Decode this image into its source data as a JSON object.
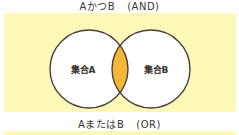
{
  "colors": {
    "panel_bg": "#fdf8b8",
    "circle_fill": "#ffffff",
    "intersection_fill": "#f6b738",
    "stroke": "#4a4038",
    "text": "#3a3530"
  },
  "sections": [
    {
      "title_main": "AかつB",
      "title_tag": "(AND)",
      "set_a_label": "集合A",
      "set_b_label": "集合B",
      "highlight": "intersection"
    },
    {
      "title_main": "AまたはB",
      "title_tag": "(OR)"
    }
  ]
}
